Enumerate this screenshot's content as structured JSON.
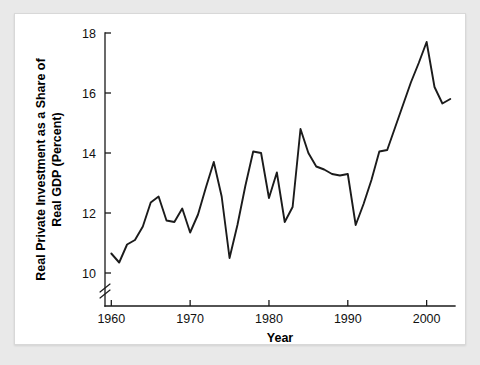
{
  "figure": {
    "background_color": "#e9e9e9",
    "plate_color": "#ffffff",
    "line_color": "#1b1b1b",
    "axis_color": "#1a1a1a"
  },
  "chart_data": {
    "type": "line",
    "title": "",
    "xlabel": "Year",
    "ylabel": "Real Private Investment as a Share of Real GDP (Percent)",
    "ylabel_line1": "Real Private Investment as a Share of",
    "ylabel_line2": "Real GDP (Percent)",
    "xlim": [
      1959.2,
      2003.6
    ],
    "ylim": [
      9.55,
      18.2
    ],
    "xticks": [
      1960,
      1970,
      1980,
      1990,
      2000
    ],
    "xtick_labels": [
      "1960",
      "1970",
      "1980",
      "1990",
      "2000"
    ],
    "yticks": [
      10,
      12,
      14,
      16,
      18
    ],
    "ytick_labels": [
      "10",
      "12",
      "14",
      "16",
      "18"
    ],
    "grid": false,
    "legend": "none",
    "axis_break": {
      "axis": "y",
      "below_value": 10,
      "symbol": "double-slash"
    },
    "series": [
      {
        "name": "Real Private Investment as a Share of Real GDP",
        "x": [
          1960,
          1961,
          1962,
          1963,
          1964,
          1965,
          1966,
          1967,
          1968,
          1969,
          1970,
          1971,
          1972,
          1973,
          1974,
          1975,
          1976,
          1977,
          1978,
          1979,
          1980,
          1981,
          1982,
          1983,
          1984,
          1985,
          1986,
          1987,
          1988,
          1989,
          1990,
          1991,
          1992,
          1993,
          1994,
          1995,
          1996,
          1997,
          1998,
          1999,
          2000,
          2001,
          2002,
          2003
        ],
        "values": [
          10.65,
          10.35,
          10.95,
          11.1,
          11.55,
          12.35,
          12.55,
          11.75,
          11.7,
          12.15,
          11.35,
          11.95,
          12.85,
          13.7,
          12.55,
          10.5,
          11.6,
          12.9,
          14.05,
          14.0,
          12.5,
          13.35,
          11.7,
          12.2,
          14.8,
          14.0,
          13.55,
          13.45,
          13.3,
          13.25,
          13.3,
          11.6,
          12.3,
          13.1,
          14.05,
          14.1,
          14.85,
          15.6,
          16.35,
          17.0,
          17.7,
          16.2,
          15.65,
          15.8
        ]
      }
    ]
  }
}
